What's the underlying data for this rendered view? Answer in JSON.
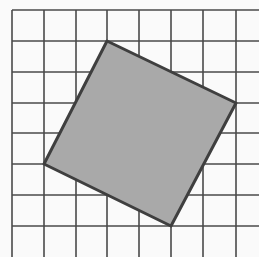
{
  "diagram": {
    "type": "grid-with-tilted-square",
    "grid": {
      "columns_x": [
        12,
        44,
        76,
        107,
        139,
        171,
        203,
        236
      ],
      "rows_y": [
        10,
        41,
        72,
        103,
        133,
        164,
        195,
        226
      ],
      "x_extent": [
        12,
        259
      ],
      "y_extent": [
        10,
        257
      ],
      "line_color": "#4a4a4a",
      "line_width": 1.6
    },
    "square": {
      "vertices": [
        [
          107,
          41
        ],
        [
          236,
          103
        ],
        [
          171,
          226
        ],
        [
          44,
          164
        ]
      ],
      "fill": "#a9a9a9",
      "stroke": "#3f3f3f",
      "stroke_width": 3
    },
    "background": "#fafafa"
  }
}
